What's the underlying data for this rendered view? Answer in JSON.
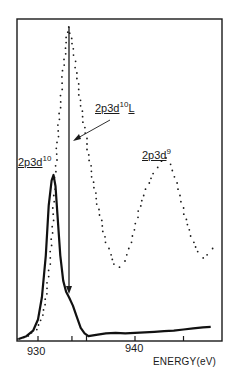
{
  "chart_data": {
    "type": "line",
    "title": "",
    "xlabel": "ENERGY(eV)",
    "ylabel": "",
    "xlim": [
      927.8,
      949.2
    ],
    "ylim": [
      0,
      1
    ],
    "grid": false,
    "legend": "none",
    "x_ticks": [
      930,
      933.5,
      935,
      940,
      945
    ],
    "x_tick_labels": [
      "930",
      "940"
    ],
    "x_tick_label_positions": [
      930,
      940
    ],
    "series": [
      {
        "name": "dotted spectrum",
        "style": "dotted",
        "x": [
          928.0,
          929.0,
          929.8,
          930.3,
          930.7,
          931.0,
          931.4,
          931.7,
          932.0,
          932.3,
          932.6,
          932.9,
          933.1,
          933.3,
          933.6,
          933.9,
          934.2,
          934.5,
          934.9,
          935.2,
          935.6,
          936.0,
          936.5,
          937.0,
          937.5,
          937.9,
          938.4,
          938.9,
          939.4,
          939.9,
          940.4,
          940.9,
          941.4,
          941.9,
          942.3,
          942.8,
          943.2,
          943.6,
          944.1,
          944.6,
          945.1,
          945.6,
          946.0,
          946.5,
          947.0,
          947.5,
          948.0,
          948.6
        ],
        "y": [
          0.0,
          0.01,
          0.03,
          0.06,
          0.11,
          0.18,
          0.3,
          0.48,
          0.63,
          0.76,
          0.86,
          0.95,
          1.0,
          0.98,
          0.93,
          0.87,
          0.8,
          0.73,
          0.66,
          0.59,
          0.52,
          0.45,
          0.38,
          0.31,
          0.27,
          0.24,
          0.23,
          0.25,
          0.29,
          0.35,
          0.41,
          0.46,
          0.5,
          0.53,
          0.55,
          0.57,
          0.58,
          0.56,
          0.52,
          0.46,
          0.4,
          0.35,
          0.31,
          0.28,
          0.26,
          0.27,
          0.29,
          0.28
        ]
      },
      {
        "name": "solid spectrum",
        "style": "solid",
        "x": [
          928.0,
          928.8,
          929.5,
          930.0,
          930.4,
          930.8,
          931.1,
          931.4,
          931.6,
          931.8,
          932.0,
          932.3,
          932.6,
          932.9,
          933.2,
          933.6,
          934.0,
          934.4,
          934.8,
          935.2,
          936.0,
          937.0,
          938.0,
          939.0,
          940.0,
          941.0,
          942.0,
          943.0,
          944.0,
          945.0,
          946.0,
          947.0,
          947.8
        ],
        "y": [
          0.0,
          0.01,
          0.03,
          0.07,
          0.15,
          0.3,
          0.48,
          0.57,
          0.59,
          0.55,
          0.45,
          0.3,
          0.21,
          0.17,
          0.15,
          0.12,
          0.08,
          0.04,
          0.02,
          0.01,
          0.015,
          0.02,
          0.022,
          0.02,
          0.022,
          0.024,
          0.026,
          0.028,
          0.03,
          0.034,
          0.038,
          0.042,
          0.044
        ]
      }
    ],
    "annotations": [
      {
        "text": "2p3d10",
        "target": "solid peak ~931.5 eV"
      },
      {
        "text": "2p3d10L",
        "target": "arrow to vertical line at ~933.2 eV"
      },
      {
        "text": "2p3d9",
        "target": "dotted satellite peak ~943 eV"
      },
      {
        "text": "vertical arrow",
        "from_y": "top",
        "to": "~933.3 eV near baseline"
      }
    ]
  },
  "labels": {
    "d10": {
      "base": "2p3d",
      "sup": "10"
    },
    "d10L": {
      "base": "2p3d",
      "sup": "10",
      "suffix": "L"
    },
    "d9": {
      "base": "2p3d",
      "sup": "9"
    }
  },
  "axis": {
    "title": "ENERGY(eV)",
    "tick_930": "930",
    "tick_940": "940"
  }
}
